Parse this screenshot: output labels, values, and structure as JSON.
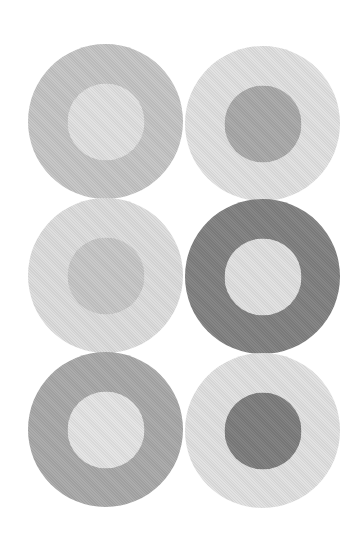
{
  "canvas": {
    "width": 363,
    "height": 535,
    "background": "#ffffff"
  },
  "circles": [
    {
      "row": 1,
      "col": "left",
      "outer": "#c4c4c4",
      "inner": "#e0e0e0"
    },
    {
      "row": 1,
      "col": "right",
      "outer": "#e0e0e0",
      "inner": "#a8a8a8"
    },
    {
      "row": 2,
      "col": "left",
      "outer": "#dcdcdc",
      "inner": "#c6c6c6"
    },
    {
      "row": 2,
      "col": "right",
      "outer": "#808080",
      "inner": "#e0e0e0"
    },
    {
      "row": 3,
      "col": "left",
      "outer": "#a8a8a8",
      "inner": "#e4e4e4"
    },
    {
      "row": 3,
      "col": "right",
      "outer": "#e0e0e0",
      "inner": "#7c7c7c"
    }
  ]
}
